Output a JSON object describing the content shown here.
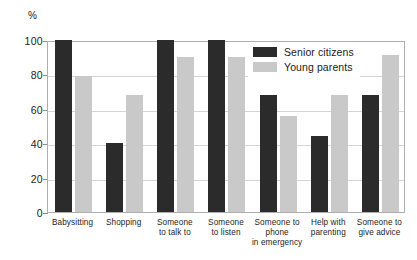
{
  "chart_data": {
    "type": "bar",
    "title": "",
    "subtitle": "",
    "xlabel": "",
    "ylabel": "%",
    "ylim": [
      0,
      100
    ],
    "yticks": [
      0,
      20,
      40,
      60,
      80,
      100
    ],
    "grid": true,
    "legend_position": "top-right",
    "categories": [
      "Babysitting",
      "Shopping",
      "Someone\nto talk to",
      "Someone\nto listen",
      "Someone to\nphone\nin emergency",
      "Help with\nparenting",
      "Someone to\ngive advice"
    ],
    "series": [
      {
        "name": "Senior citizens",
        "color": "#2b2b2b",
        "values": [
          100,
          40,
          100,
          100,
          68,
          44,
          68
        ]
      },
      {
        "name": "Young parents",
        "color": "#c9c9c9",
        "values": [
          79,
          68,
          90,
          90,
          56,
          68,
          91
        ]
      }
    ]
  },
  "axis": {
    "y_unit_label": "%",
    "y_tick_labels": [
      "0",
      "20",
      "40",
      "60",
      "80",
      "100"
    ]
  },
  "legend": {
    "items": [
      {
        "label": "Senior citizens",
        "swatch": "senior"
      },
      {
        "label": "Young parents",
        "swatch": "young"
      }
    ]
  },
  "colors": {
    "senior": "#2b2b2b",
    "young": "#c9c9c9",
    "grid": "#d4d4d4",
    "frame": "#aeaeae",
    "background": "#ffffff",
    "text": "#1a1a1a"
  }
}
